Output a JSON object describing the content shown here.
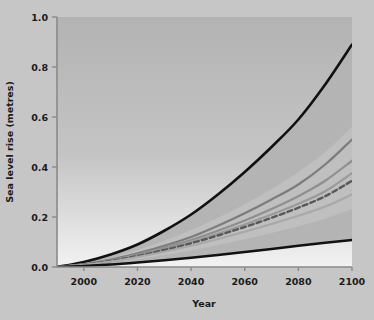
{
  "chart_data": {
    "type": "line",
    "title": "",
    "xlabel": "Year",
    "ylabel": "Sea level rise (metres)",
    "xlim": [
      1990,
      2100
    ],
    "ylim": [
      0.0,
      1.0
    ],
    "grid": false,
    "legend": "none",
    "x_ticks": [
      2000,
      2020,
      2040,
      2060,
      2080,
      2100
    ],
    "x_tick_labels": [
      "2000",
      "2020",
      "2040",
      "2060",
      "2080",
      "2100"
    ],
    "y_ticks": [
      0.0,
      0.2,
      0.4,
      0.6,
      0.8,
      1.0
    ],
    "y_tick_labels": [
      "0.0",
      "0.2",
      "0.4",
      "0.6",
      "0.8",
      "1.0"
    ],
    "x": [
      1990,
      2000,
      2010,
      2020,
      2030,
      2040,
      2050,
      2060,
      2070,
      2080,
      2090,
      2100
    ],
    "series": [
      {
        "name": "Upper envelope (high scenario)",
        "style": "solid",
        "color": "#111111",
        "width": 2.6,
        "values": [
          0.0,
          0.02,
          0.05,
          0.09,
          0.145,
          0.21,
          0.29,
          0.38,
          0.48,
          0.59,
          0.73,
          0.89
        ]
      },
      {
        "name": "Scenario A",
        "style": "solid",
        "color": "#7c7c7c",
        "width": 2.2,
        "values": [
          0.0,
          0.012,
          0.03,
          0.055,
          0.085,
          0.12,
          0.165,
          0.215,
          0.27,
          0.33,
          0.41,
          0.51
        ]
      },
      {
        "name": "Scenario B",
        "style": "solid",
        "color": "#8f8f8f",
        "width": 2.2,
        "values": [
          0.0,
          0.011,
          0.027,
          0.05,
          0.077,
          0.108,
          0.145,
          0.186,
          0.232,
          0.283,
          0.345,
          0.425
        ]
      },
      {
        "name": "Scenario C",
        "style": "solid",
        "color": "#9a9a9a",
        "width": 2.2,
        "values": [
          0.0,
          0.01,
          0.025,
          0.046,
          0.071,
          0.1,
          0.133,
          0.17,
          0.21,
          0.253,
          0.303,
          0.375
        ]
      },
      {
        "name": "Central estimate",
        "style": "dashed",
        "color": "#585858",
        "width": 2.4,
        "values": [
          0.0,
          0.01,
          0.024,
          0.044,
          0.068,
          0.095,
          0.126,
          0.16,
          0.197,
          0.237,
          0.283,
          0.345
        ]
      },
      {
        "name": "Scenario D",
        "style": "solid",
        "color": "#a8a8a8",
        "width": 2.2,
        "values": [
          0.0,
          0.009,
          0.022,
          0.04,
          0.061,
          0.085,
          0.112,
          0.141,
          0.172,
          0.205,
          0.242,
          0.29
        ]
      },
      {
        "name": "Lower envelope (low scenario)",
        "style": "solid",
        "color": "#111111",
        "width": 2.4,
        "values": [
          0.0,
          0.004,
          0.01,
          0.018,
          0.027,
          0.037,
          0.048,
          0.06,
          0.072,
          0.085,
          0.097,
          0.108
        ]
      }
    ],
    "bands": [
      {
        "name": "Full model range (outer)",
        "color": "#b4b4b4",
        "opacity": 1.0,
        "lower": [
          0.0,
          0.004,
          0.01,
          0.018,
          0.027,
          0.037,
          0.048,
          0.06,
          0.072,
          0.085,
          0.097,
          0.108
        ],
        "upper": [
          0.0,
          0.02,
          0.05,
          0.09,
          0.145,
          0.21,
          0.29,
          0.38,
          0.48,
          0.59,
          0.73,
          0.89
        ]
      },
      {
        "name": "Likely range (inner)",
        "color": "#bfbfbf",
        "opacity": 1.0,
        "lower": [
          0.0,
          0.007,
          0.017,
          0.031,
          0.048,
          0.067,
          0.088,
          0.111,
          0.136,
          0.163,
          0.193,
          0.232
        ],
        "upper": [
          0.0,
          0.015,
          0.037,
          0.068,
          0.105,
          0.148,
          0.197,
          0.251,
          0.312,
          0.38,
          0.46,
          0.56
        ]
      }
    ],
    "plot_background": "#c0c0c0",
    "figure_background": "#c6c6c6",
    "light_region_color": "#f4f4f4",
    "axis_color": "#8a8a8a"
  }
}
